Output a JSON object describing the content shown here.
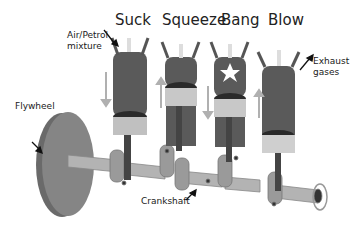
{
  "title_partial": "",
  "stages": [
    "Suck",
    "Squeeze",
    "Bang",
    "Blow"
  ],
  "labels": {
    "intake": [
      "Air/Petrol",
      "mixture"
    ],
    "exhaust": [
      "Exhaust",
      "gases"
    ],
    "flywheel": "Flywheel",
    "crankshaft": "Crankshaft"
  },
  "colors": {
    "cylinder": "#5a5a5a",
    "piston": "#bdbdbd",
    "shaft": "#a8a8a8",
    "flywheel": "#7a7a7a",
    "arrow": "#b0b0b0"
  }
}
